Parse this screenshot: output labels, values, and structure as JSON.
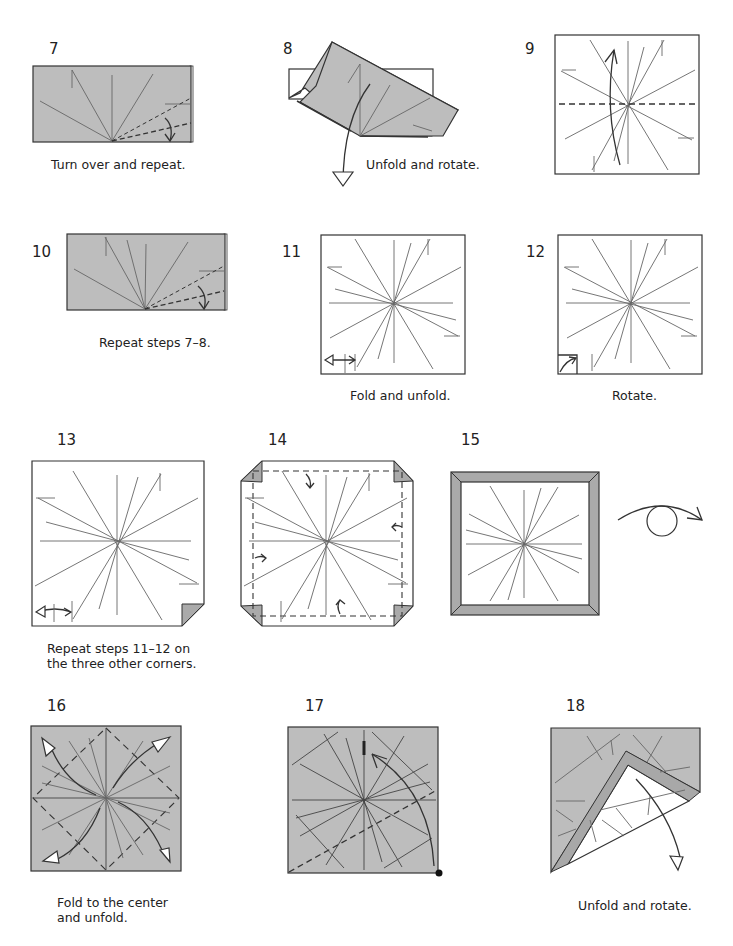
{
  "page": {
    "type": "origami instruction diagram sheet",
    "background": "#ffffff",
    "paper_color": "#bdbdbd",
    "line_color": "#333333"
  },
  "steps": [
    {
      "number": "7",
      "caption": "Turn over and repeat."
    },
    {
      "number": "8",
      "caption": "Unfold and rotate."
    },
    {
      "number": "9",
      "caption": ""
    },
    {
      "number": "10",
      "caption": "Repeat steps 7–8."
    },
    {
      "number": "11",
      "caption": "Fold and unfold."
    },
    {
      "number": "12",
      "caption": "Rotate."
    },
    {
      "number": "13",
      "caption_line1": "Repeat steps 11–12 on",
      "caption_line2": "the three other corners."
    },
    {
      "number": "14",
      "caption": ""
    },
    {
      "number": "15",
      "caption": "",
      "symbol": "turn-over-icon"
    },
    {
      "number": "16",
      "caption_line1": "Fold to the center",
      "caption_line2": "and unfold."
    },
    {
      "number": "17",
      "caption": ""
    },
    {
      "number": "18",
      "caption": "Unfold and rotate."
    }
  ]
}
